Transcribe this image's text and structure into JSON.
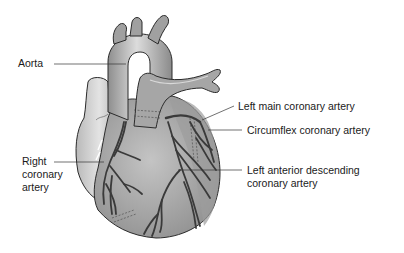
{
  "diagram": {
    "labels": [
      {
        "id": "aorta",
        "text": "Aorta"
      },
      {
        "id": "right-coronary-artery",
        "text": "Right\ncoronary\nartery"
      },
      {
        "id": "left-main-coronary-artery",
        "text": "Left main coronary artery"
      },
      {
        "id": "circumflex-coronary-artery",
        "text": "Circumflex coronary artery"
      },
      {
        "id": "left-anterior-descending",
        "text": "Left anterior descending\ncoronary artery"
      }
    ],
    "colors": {
      "background": "#ffffff",
      "heart_fill": "#a9a9a9",
      "heart_light": "#d4d4d4",
      "atrium_fill": "#cfcfcf",
      "artery_stroke": "#3a3a3a",
      "outline": "#2b2b2b",
      "leader_line": "#333333",
      "text": "#1a1a1a"
    }
  }
}
